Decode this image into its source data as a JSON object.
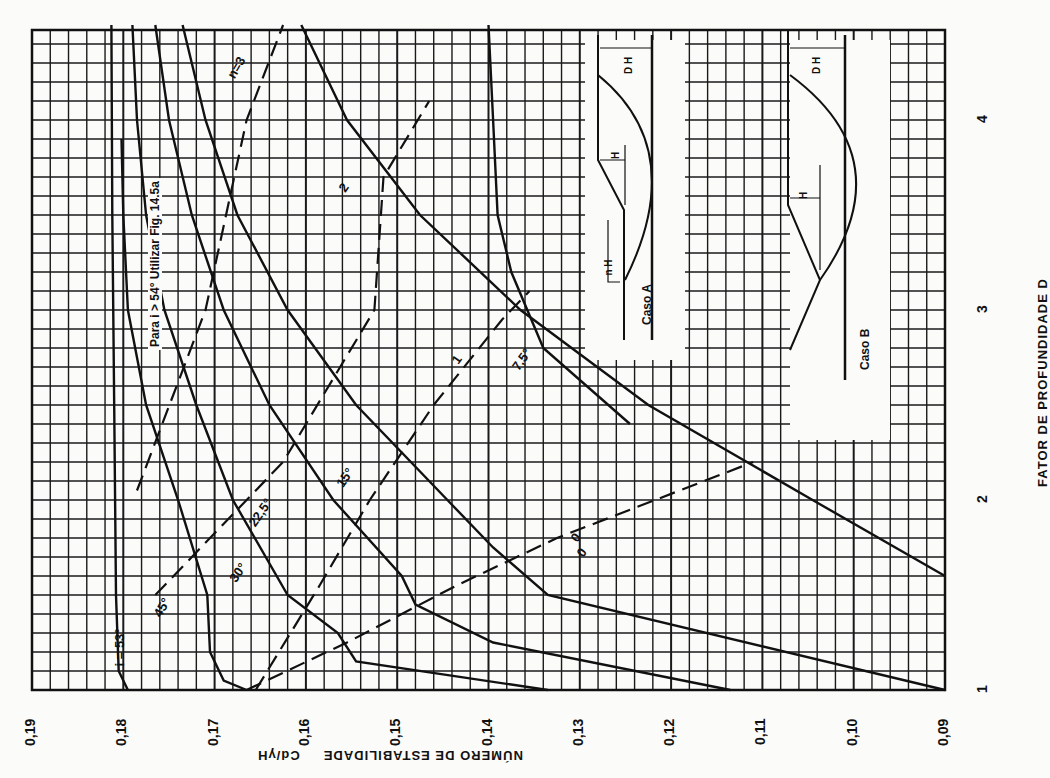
{
  "chart_data": {
    "type": "line",
    "title": "",
    "orientation": "rotated 90deg clockwise (x-axis vertical, bottom to top; y-axis horizontal, decreasing left to right)",
    "xlabel": "FATOR DE PROFUNDIDADE D",
    "ylabel": "NÚMERO DE ESTABILIDADE Cd/γH",
    "xlim": [
      1,
      4.5
    ],
    "ylim": [
      0.09,
      0.19
    ],
    "x_ticks": [
      "1",
      "2",
      "3",
      "4"
    ],
    "y_ticks": [
      "0,19",
      "0,18",
      "0,17",
      "0,16",
      "0,15",
      "0,14",
      "0,13",
      "0,12",
      "0,11",
      "0,10",
      "0,09"
    ],
    "grid": true,
    "note": "Para i > 54° Utilizar Fig. 14.5a",
    "series": [
      {
        "name": "i = 53°",
        "label": "i = 53°",
        "style": "solid",
        "points": [
          [
            1.0,
            0.1795
          ],
          [
            1.1,
            0.1805
          ],
          [
            1.5,
            0.1808
          ],
          [
            2.5,
            0.181
          ],
          [
            3.5,
            0.1812
          ],
          [
            4.5,
            0.1813
          ]
        ]
      },
      {
        "name": "45°",
        "label": "45°",
        "style": "solid",
        "points": [
          [
            1.0,
            0.1665
          ],
          [
            1.05,
            0.169
          ],
          [
            1.2,
            0.1705
          ],
          [
            1.5,
            0.1708
          ],
          [
            2.0,
            0.174
          ],
          [
            2.5,
            0.1775
          ],
          [
            3.0,
            0.1795
          ],
          [
            3.5,
            0.18
          ],
          [
            3.9,
            0.1802
          ]
        ]
      },
      {
        "name": "30°",
        "label": "30°",
        "style": "solid",
        "points": [
          [
            1.0,
            0.1335
          ],
          [
            1.15,
            0.1545
          ],
          [
            1.3,
            0.1565
          ],
          [
            1.5,
            0.162
          ],
          [
            2.0,
            0.168
          ],
          [
            2.5,
            0.172
          ],
          [
            3.0,
            0.1755
          ],
          [
            3.5,
            0.1775
          ],
          [
            4.0,
            0.1785
          ],
          [
            4.5,
            0.179
          ]
        ]
      },
      {
        "name": "22.5°",
        "label": "22,5°",
        "style": "solid",
        "points": [
          [
            1.0,
            0.1135
          ],
          [
            1.25,
            0.1395
          ],
          [
            1.45,
            0.148
          ],
          [
            1.6,
            0.1495
          ],
          [
            2.0,
            0.157
          ],
          [
            2.5,
            0.164
          ],
          [
            3.0,
            0.169
          ],
          [
            3.5,
            0.1725
          ],
          [
            4.0,
            0.175
          ],
          [
            4.5,
            0.1765
          ]
        ]
      },
      {
        "name": "15°",
        "label": "15°",
        "style": "solid",
        "points": [
          [
            1.0,
            0.09
          ],
          [
            1.5,
            0.1335
          ],
          [
            1.75,
            0.1395
          ],
          [
            2.0,
            0.1445
          ],
          [
            2.5,
            0.1545
          ],
          [
            3.0,
            0.162
          ],
          [
            3.5,
            0.1675
          ],
          [
            4.0,
            0.171
          ],
          [
            4.5,
            0.1735
          ]
        ]
      },
      {
        "name": "7.5°",
        "label": "7,5°",
        "style": "solid",
        "points": [
          [
            1.6,
            0.09
          ],
          [
            2.0,
            0.1045
          ],
          [
            2.5,
            0.1225
          ],
          [
            3.0,
            0.1365
          ],
          [
            3.5,
            0.1475
          ],
          [
            4.0,
            0.1555
          ],
          [
            4.5,
            0.1605
          ]
        ]
      },
      {
        "name": "0°",
        "label": "0",
        "style": "solid",
        "points": [
          [
            2.4,
            0.1245
          ],
          [
            2.8,
            0.134
          ],
          [
            3.2,
            0.1375
          ],
          [
            3.5,
            0.139
          ],
          [
            4.0,
            0.1395
          ],
          [
            4.5,
            0.14
          ]
        ]
      },
      {
        "name": "n = 3",
        "label": "n=3",
        "style": "dashed",
        "points": [
          [
            2.05,
            0.1785
          ],
          [
            3.0,
            0.171
          ],
          [
            4.0,
            0.1665
          ],
          [
            4.5,
            0.1625
          ]
        ]
      },
      {
        "name": "n = 2",
        "label": "2",
        "style": "dashed",
        "points": [
          [
            1.5,
            0.1765
          ],
          [
            2.2,
            0.1625
          ],
          [
            3.0,
            0.1525
          ],
          [
            3.7,
            0.1515
          ],
          [
            4.1,
            0.1465
          ]
        ]
      },
      {
        "name": "n = 1",
        "label": "1",
        "style": "dashed",
        "points": [
          [
            1.0,
            0.1655
          ],
          [
            1.55,
            0.1585
          ],
          [
            2.0,
            0.153
          ],
          [
            2.5,
            0.146
          ],
          [
            2.95,
            0.1385
          ],
          [
            3.1,
            0.1355
          ]
        ]
      },
      {
        "name": "n = 0",
        "label": "0",
        "style": "dashed",
        "points": [
          [
            1.0,
            0.1665
          ],
          [
            1.25,
            0.1555
          ],
          [
            1.55,
            0.1435
          ],
          [
            1.8,
            0.1325
          ],
          [
            2.2,
            0.111
          ]
        ]
      }
    ],
    "annotations": [
      "i = 53°",
      "45°",
      "30°",
      "22,5°",
      "15°",
      "7,5°",
      "n=3",
      "2",
      "1",
      "0",
      "Caso A",
      "Caso B",
      "D H",
      "H",
      "n H"
    ]
  },
  "axes": {
    "y_title": "NÚMERO DE ESTABILIDADE",
    "y_unit": "Cd/γH",
    "x_title": "FATOR DE PROFUNDIDADE  D"
  },
  "insets": {
    "case_a": {
      "label": "Caso A",
      "dims": [
        "D H",
        "H",
        "n H"
      ]
    },
    "case_b": {
      "label": "Caso B",
      "dims": [
        "D H",
        "H"
      ]
    }
  },
  "colors": {
    "ink": "#111111",
    "paper": "#fbfbfa",
    "grid": "#1a1a1a"
  }
}
